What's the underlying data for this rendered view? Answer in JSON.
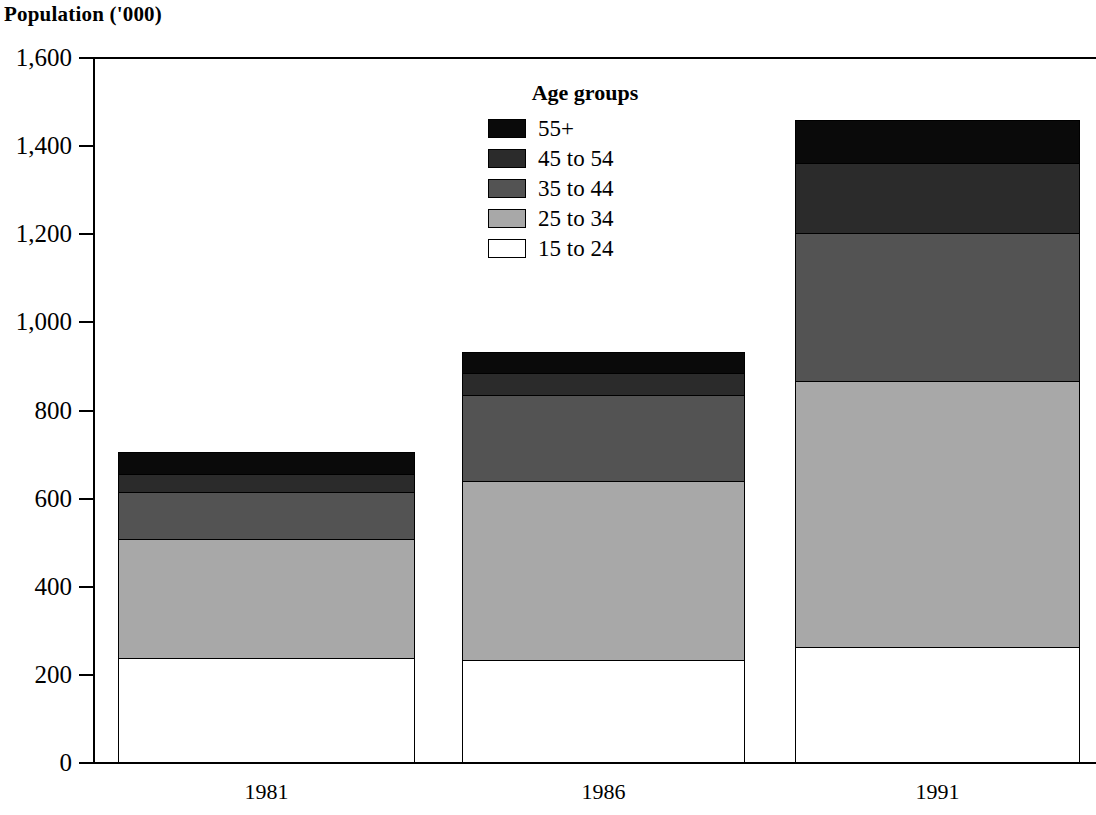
{
  "chart_data": {
    "type": "bar",
    "subtype": "stacked",
    "title": "Population ('000)",
    "xlabel": "",
    "ylabel": "Population ('000)",
    "categories": [
      "1981",
      "1986",
      "1991"
    ],
    "ylim": [
      0,
      1600
    ],
    "ytick_labels": [
      "0",
      "200",
      "400",
      "600",
      "800",
      "1,000",
      "1,200",
      "1,400",
      "1,600"
    ],
    "ytick_values": [
      0,
      200,
      400,
      600,
      800,
      1000,
      1200,
      1400,
      1600
    ],
    "grid": false,
    "legend_title": "Age groups",
    "legend_position": "inside-top-center",
    "series": [
      {
        "name": "15 to 24",
        "color": "#ffffff",
        "values": [
          235,
          232,
          260
        ]
      },
      {
        "name": "25 to 34",
        "color": "#a8a8a8",
        "values": [
          271,
          405,
          605
        ]
      },
      {
        "name": "35 to 44",
        "color": "#535353",
        "values": [
          107,
          195,
          335
        ]
      },
      {
        "name": "45 to 54",
        "color": "#2b2b2b",
        "values": [
          41,
          50,
          160
        ]
      },
      {
        "name": "55+",
        "color": "#0a0a0a",
        "values": [
          49,
          48,
          95
        ]
      }
    ],
    "stack_order_bottom_to_top": [
      "15 to 24",
      "25 to 34",
      "35 to 44",
      "45 to 54",
      "55+"
    ],
    "totals": [
      703,
      930,
      1455
    ]
  },
  "legend": {
    "title": "Age groups",
    "items": [
      {
        "label": "55+",
        "color": "#0a0a0a"
      },
      {
        "label": "45 to 54",
        "color": "#2b2b2b"
      },
      {
        "label": "35 to 44",
        "color": "#535353"
      },
      {
        "label": "25 to 34",
        "color": "#a8a8a8"
      },
      {
        "label": "15 to 24",
        "color": "#ffffff"
      }
    ]
  },
  "axes": {
    "y_ticks": [
      {
        "label": "1,600",
        "value": 1600
      },
      {
        "label": "1,400",
        "value": 1400
      },
      {
        "label": "1,200",
        "value": 1200
      },
      {
        "label": "1,000",
        "value": 1000
      },
      {
        "label": "800",
        "value": 800
      },
      {
        "label": "600",
        "value": 600
      },
      {
        "label": "400",
        "value": 400
      },
      {
        "label": "200",
        "value": 200
      },
      {
        "label": "0",
        "value": 0
      }
    ],
    "x_ticks": [
      {
        "label": "1981"
      },
      {
        "label": "1986"
      },
      {
        "label": "1991"
      }
    ]
  },
  "title": "Population ('000)"
}
